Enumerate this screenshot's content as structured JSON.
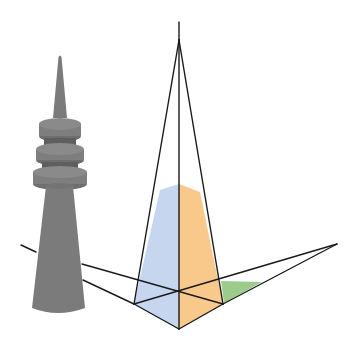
{
  "figure": {
    "colors": {
      "background": "#ffffff",
      "tower": "#7b7b7b",
      "tower_shade": "#6a6a6a",
      "tower_light": "#8e8e8e",
      "face_left": "#c6d6ee",
      "face_right": "#f9c98b",
      "ground_triangle": "#9ccc8c",
      "lines": "#1a1a1a"
    },
    "points": {
      "apex": [
        179,
        42
      ],
      "apex_tip": [
        179,
        22
      ],
      "base_left": [
        134,
        304
      ],
      "base_front": [
        179,
        329
      ],
      "base_right": [
        223,
        304
      ],
      "base_center": [
        179,
        292
      ],
      "vanishing_left": [
        21,
        245
      ],
      "vanishing_right": [
        337,
        244
      ]
    }
  }
}
